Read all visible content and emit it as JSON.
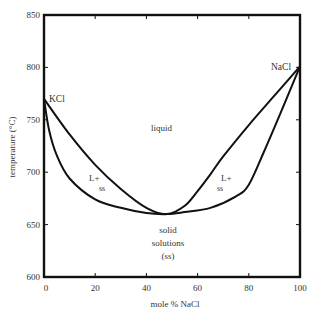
{
  "chart_data": {
    "type": "line",
    "title": "",
    "subtitle": "KCl–NaCl binary phase diagram",
    "xlabel": "mole % NaCl",
    "ylabel": "temperature (°C)",
    "xlim": [
      0,
      100
    ],
    "ylim": [
      600,
      850
    ],
    "x_ticks": [
      0,
      20,
      40,
      60,
      80,
      100
    ],
    "y_ticks": [
      600,
      650,
      700,
      750,
      800,
      850
    ],
    "grid": false,
    "legend": null,
    "series": [
      {
        "name": "liquidus",
        "x": [
          0,
          10,
          20,
          30,
          40,
          48,
          55,
          60,
          65,
          70,
          80,
          90,
          100
        ],
        "y": [
          770,
          736,
          707,
          684,
          666,
          660,
          668,
          682,
          698,
          715,
          745,
          773,
          801
        ]
      },
      {
        "name": "solidus",
        "x": [
          0,
          2,
          5,
          10,
          20,
          30,
          40,
          48,
          55,
          65,
          75,
          80,
          86,
          93,
          100
        ],
        "y": [
          770,
          740,
          716,
          694,
          674,
          666,
          661,
          660,
          662,
          666,
          677,
          688,
          720,
          760,
          801
        ]
      }
    ],
    "annotations": [
      {
        "text": "KCl",
        "x": 1.5,
        "y": 770,
        "note": "melting point of KCl ≈ 770 °C"
      },
      {
        "text": "NaCl",
        "x": 93,
        "y": 801,
        "note": "melting point of NaCl ≈ 801 °C"
      },
      {
        "text": "liquid",
        "x": 51,
        "y": 746
      },
      {
        "text": "L+",
        "x": 20,
        "y": 697
      },
      {
        "text": "ss",
        "x": 22,
        "y": 686
      },
      {
        "text": "L+",
        "x": 75,
        "y": 697
      },
      {
        "text": "ss",
        "x": 74,
        "y": 686
      },
      {
        "text": "solid",
        "x": 48,
        "y": 641
      },
      {
        "text": "solutions",
        "x": 48,
        "y": 629
      },
      {
        "text": "(ss)",
        "x": 48,
        "y": 616
      }
    ],
    "minimum_point": {
      "x": 48,
      "y": 660
    }
  },
  "labels": {
    "x_axis_title": "mole % NaCl",
    "y_axis_title": "temperature (°C)",
    "kcl": "KCl",
    "nacl": "NaCl",
    "liquid": "liquid",
    "l_plus_left": "L+",
    "ss_left": "ss",
    "l_plus_right": "L+",
    "ss_right": "ss",
    "solid": "solid",
    "solutions": "solutions",
    "ss_paren": "(ss)"
  }
}
